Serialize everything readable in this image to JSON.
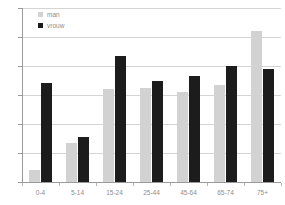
{
  "chart_data": {
    "type": "bar",
    "title": "",
    "subtitle": "",
    "xlabel": "",
    "ylabel": "",
    "categories": [
      "0-4",
      "5-14",
      "15-24",
      "25-44",
      "45-64",
      "65-74",
      "75+"
    ],
    "series": [
      {
        "name": "man",
        "color": "#d2d2d2",
        "values": [
          0.4,
          1.35,
          3.2,
          3.25,
          3.1,
          3.35,
          5.2
        ]
      },
      {
        "name": "vrouw",
        "color": "#1c1c1c",
        "values": [
          3.4,
          1.55,
          4.35,
          3.5,
          3.65,
          4.0,
          3.9
        ]
      }
    ],
    "ylim": [
      0,
      6
    ],
    "yticks": [
      0,
      1,
      2,
      3,
      4,
      5,
      6
    ],
    "ytick_labels": [
      "0",
      "1",
      "2",
      "3",
      "4",
      "5",
      "6"
    ],
    "grid": true,
    "grid_axis": "y",
    "legend_position": "top-left-inside",
    "legend_entries": [
      "man",
      "vrouw"
    ],
    "annotations": []
  },
  "axes": {
    "y_axis_color": "#9a9a9a",
    "x_axis_color": "#9a9a9a",
    "gridline_color": "#d4d4d4",
    "tick_label_color": "#8d8d8d"
  },
  "legend": {
    "items": [
      {
        "label": "man",
        "swatch_class": "man",
        "icon": "square-swatch-icon"
      },
      {
        "label": "vrouw",
        "swatch_class": "vrouw",
        "icon": "square-swatch-icon"
      }
    ]
  }
}
